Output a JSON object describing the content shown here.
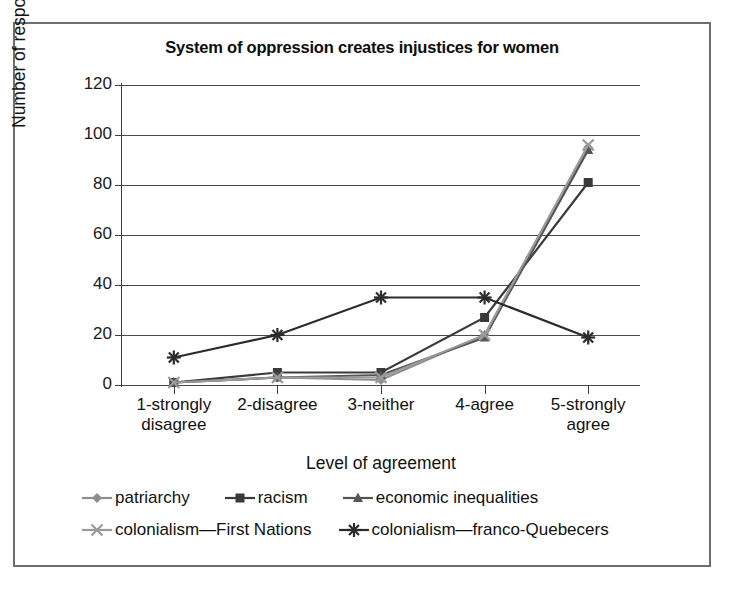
{
  "chart_data": {
    "type": "line",
    "title": "System of oppression creates injustices for women",
    "xlabel": "Level of agreement",
    "ylabel": "Number of respondents",
    "categories": [
      "1-strongly disagree",
      "2-disagree",
      "3-neither",
      "4-agree",
      "5-strongly agree"
    ],
    "category_lines": [
      [
        "1-strongly",
        "disagree"
      ],
      [
        "2-disagree",
        ""
      ],
      [
        "3-neither",
        ""
      ],
      [
        "4-agree",
        ""
      ],
      [
        "5-strongly",
        "agree"
      ]
    ],
    "ylim": [
      0,
      120
    ],
    "yticks": [
      0,
      20,
      40,
      60,
      80,
      100,
      120
    ],
    "ytick_labels": [
      "0",
      "20",
      "40",
      "60",
      "80",
      "100",
      "120"
    ],
    "grid": true,
    "legend_position": "bottom",
    "series": [
      {
        "name": "patriarchy",
        "marker": "diamond",
        "color": "#8e8e8e",
        "values": [
          1,
          3,
          2,
          20,
          95
        ]
      },
      {
        "name": "racism",
        "marker": "square",
        "color": "#3a3a3a",
        "values": [
          1,
          5,
          5,
          27,
          81
        ]
      },
      {
        "name": "economic inequalities",
        "marker": "triangle",
        "color": "#555555",
        "values": [
          1,
          3,
          4,
          19,
          94
        ]
      },
      {
        "name": "colonialism—First Nations",
        "marker": "x",
        "color": "#9a9a9a",
        "values": [
          1,
          3,
          3,
          20,
          96
        ]
      },
      {
        "name": "colonialism—franco-Quebecers",
        "marker": "asterisk",
        "color": "#2b2b2b",
        "values": [
          11,
          20,
          35,
          35,
          19
        ]
      }
    ]
  }
}
